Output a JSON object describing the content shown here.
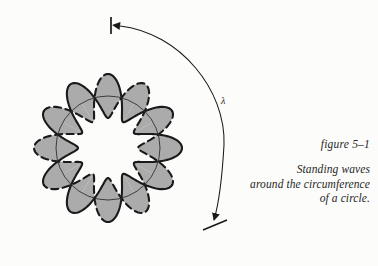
{
  "figure": {
    "id": "figure 5–1",
    "caption_lines": [
      "Standing waves",
      "around the circumference",
      "of a circle."
    ],
    "wavelength_label": "λ",
    "colors": {
      "background": "#fcfcfb",
      "fill_gray": "#ababab",
      "stroke_dark": "#1a1a1a",
      "stroke_thin": "#2b2b2b",
      "text": "#262626"
    },
    "geometry": {
      "center_x": 108,
      "center_y": 148,
      "base_radius": 52,
      "lobe_count": 6,
      "lobe_bulge": 22,
      "node_angles_deg": [
        0,
        60,
        120,
        180,
        240,
        300
      ]
    },
    "annotation": {
      "arc_start": "top tick with left-pointing arrowhead",
      "arc_end": "bottom tick with down-pointing arrowhead",
      "arc_meaning": "one wavelength measured along the circumference"
    }
  },
  "chart_data": {
    "type": "line",
    "title": "figure 5–1",
    "subtitle": "Standing waves around the circumference of a circle.",
    "x": "theta (degrees, 0 to 360)",
    "series": [
      {
        "name": "base circle",
        "radius": 52,
        "style": "thin solid"
      },
      {
        "name": "standing wave phase +",
        "formula": "52 + 22*cos(6*theta)",
        "style": "thick solid"
      },
      {
        "name": "standing wave phase -",
        "formula": "52 - 22*cos(6*theta)",
        "style": "thick dashed"
      }
    ],
    "annotations": [
      {
        "label": "λ",
        "x": 223,
        "y": 100,
        "kind": "wavelength-arc-label"
      }
    ],
    "nodes_deg": [
      30,
      90,
      150,
      210,
      270,
      330
    ],
    "antinodes_deg": [
      0,
      60,
      120,
      180,
      240,
      300
    ],
    "xlabel": "",
    "ylabel": "",
    "grid": false,
    "legend": "none"
  }
}
